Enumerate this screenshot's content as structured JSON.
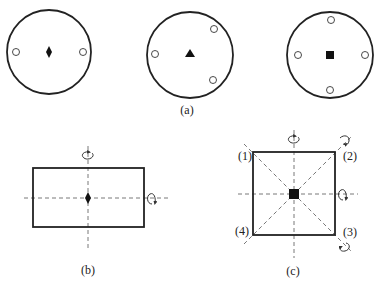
{
  "figure": {
    "panel_a": {
      "label": "(a)",
      "circles": [
        {
          "symbol": "diamond",
          "fold": 2,
          "sites": 2
        },
        {
          "symbol": "triangle",
          "fold": 3,
          "sites": 3
        },
        {
          "symbol": "square",
          "fold": 4,
          "sites": 4
        }
      ]
    },
    "panel_b": {
      "label": "(b)",
      "shape": "rectangle",
      "center_symbol": "diamond",
      "axes": [
        "vertical",
        "horizontal"
      ]
    },
    "panel_c": {
      "label": "(c)",
      "shape": "square",
      "center_symbol": "square",
      "corner_labels": [
        "(1)",
        "(2)",
        "(3)",
        "(4)"
      ],
      "axes": [
        "vertical",
        "horizontal",
        "diagonal-1-3",
        "diagonal-2-4"
      ]
    }
  }
}
